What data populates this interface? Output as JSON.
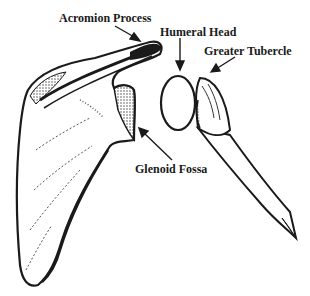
{
  "diagram": {
    "labels": [
      {
        "id": "acromion",
        "text": "Acromion Process"
      },
      {
        "id": "humeral_head",
        "text": "Humeral Head"
      },
      {
        "id": "greater_tubercle",
        "text": "Greater Tubercle"
      },
      {
        "id": "glenoid_fossa",
        "text": "Glenoid Fossa"
      }
    ],
    "colors": {
      "ink": "#1a1a1a",
      "background": "#ffffff",
      "shade": "#555555"
    }
  }
}
